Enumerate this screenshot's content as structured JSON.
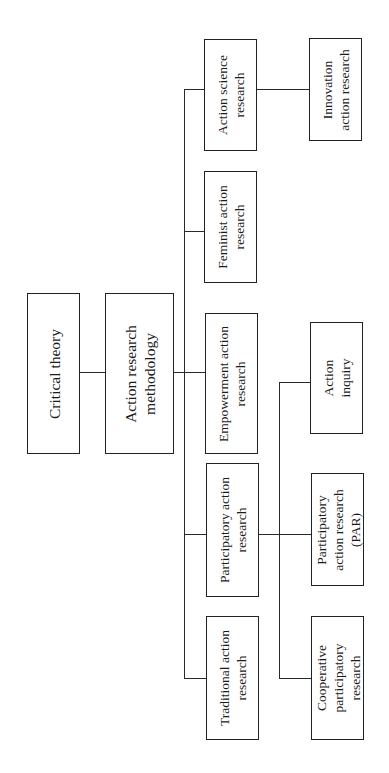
{
  "diagram": {
    "type": "hierarchy",
    "orientation": "rotated-90-ccw",
    "nodes": {
      "critical_theory": "Critical theory",
      "arm": "Action research\nmethodology",
      "action_science": "Action science\nresearch",
      "innovation": "Innovation\naction research",
      "feminist": "Feminist action\nresearch",
      "empowerment": "Empowerment action\nresearch",
      "participatory": "Participatory action\nresearch",
      "traditional": "Traditional action\nresearch",
      "action_inquiry": "Action\ninquiry",
      "par": "Participatory\naction research\n(PAR)",
      "cooperative": "Cooperative\nparticipatory\nresearch"
    },
    "edges": [
      [
        "Critical theory",
        "Action research methodology"
      ],
      [
        "Action research methodology",
        "Action science research"
      ],
      [
        "Action research methodology",
        "Feminist action research"
      ],
      [
        "Action research methodology",
        "Empowerment action research"
      ],
      [
        "Action research methodology",
        "Participatory action research"
      ],
      [
        "Action research methodology",
        "Traditional action research"
      ],
      [
        "Action science research",
        "Innovation action research"
      ],
      [
        "Participatory action research",
        "Action inquiry"
      ],
      [
        "Participatory action research",
        "Participatory action research (PAR)"
      ],
      [
        "Participatory action research",
        "Cooperative participatory research"
      ]
    ]
  }
}
